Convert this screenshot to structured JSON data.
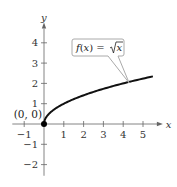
{
  "chart_data": {
    "type": "line",
    "title": "",
    "xlabel": "x",
    "ylabel": "y",
    "xlim": [
      -1.5,
      5.7
    ],
    "ylim": [
      -2.6,
      4.8
    ],
    "x_ticks": [
      -1,
      1,
      2,
      3,
      4,
      5
    ],
    "y_ticks": [
      -2,
      -1,
      1,
      2,
      3,
      4
    ],
    "grid": false,
    "series": [
      {
        "name": "f(x) = √x",
        "function": "sqrt",
        "domain": [
          0,
          5.5
        ],
        "color": "#111111"
      }
    ],
    "points": [
      {
        "x": 0,
        "y": 0,
        "label": "(0, 0)"
      }
    ],
    "annotations": [
      {
        "text_prefix": "f(x) = ",
        "text_radical": "x",
        "points_to_x": 4.3
      }
    ]
  }
}
